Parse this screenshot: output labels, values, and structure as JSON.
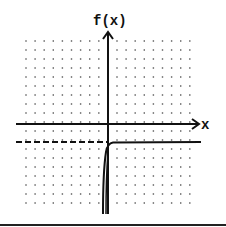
{
  "chart_data": {
    "type": "line",
    "title": "",
    "xlabel": "x",
    "ylabel": "f(x)",
    "grid": "dotted",
    "xlim": [
      -9,
      9
    ],
    "ylim": [
      -10,
      10
    ],
    "asymptote": {
      "type": "horizontal",
      "y": -2,
      "style": "dashed"
    },
    "series": [
      {
        "name": "f(x)",
        "points": [
          [
            -0.2,
            -10
          ],
          [
            0,
            -7
          ],
          [
            0.2,
            -4
          ],
          [
            0.5,
            -2.5
          ],
          [
            1,
            -2.1
          ],
          [
            2,
            -2.02
          ],
          [
            4,
            -2
          ],
          [
            9,
            -2
          ]
        ]
      }
    ]
  },
  "labels": {
    "y_axis": "f(x)",
    "x_axis": "x"
  }
}
